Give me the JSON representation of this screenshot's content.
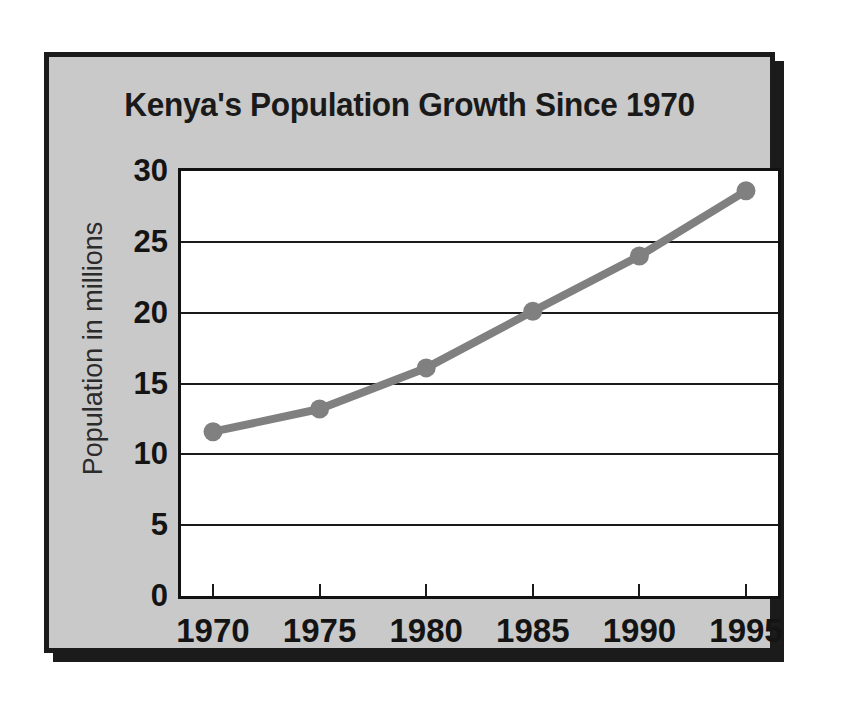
{
  "figure": {
    "title": "Kenya's Population Growth Since  1970",
    "panel_color": "#c9c9c9",
    "border_color": "#1b1b1b",
    "plot_background": "#ffffff"
  },
  "chart_data": {
    "type": "line",
    "title": "Kenya's Population Growth Since  1970",
    "xlabel": "",
    "ylabel": "Population in millions",
    "categories": [
      "1970",
      "1975",
      "1980",
      "1985",
      "1990",
      "1995"
    ],
    "x": [
      1970,
      1975,
      1980,
      1985,
      1990,
      1995
    ],
    "values": [
      11.6,
      13.2,
      16.1,
      20.1,
      24.0,
      28.6
    ],
    "series": [
      {
        "name": "Population in millions",
        "values": [
          11.6,
          13.2,
          16.1,
          20.1,
          24.0,
          28.6
        ],
        "color": "#808080",
        "marker": "circle"
      }
    ],
    "xlim": [
      1968.5,
      1996.5
    ],
    "ylim": [
      0,
      30
    ],
    "yticks": [
      0,
      5,
      10,
      15,
      20,
      25,
      30
    ],
    "ytick_labels": [
      "0",
      "5",
      "10",
      "15",
      "20",
      "25",
      "30"
    ],
    "xticks": [
      1970,
      1975,
      1980,
      1985,
      1990,
      1995
    ],
    "xtick_labels": [
      "1970",
      "1975",
      "1980",
      "1985",
      "1990",
      "1995"
    ],
    "grid": "horizontal",
    "legend": "none",
    "line_color": "#808080",
    "gridline_color": "#1a1a1a",
    "units": "millions of people"
  }
}
